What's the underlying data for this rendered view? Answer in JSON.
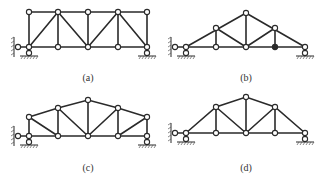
{
  "figure": {
    "panels": [
      {
        "id": "a",
        "label": "(a)",
        "type": "parallel-chord truss",
        "top_nodes": [
          [
            29,
            12
          ],
          [
            58,
            12
          ],
          [
            88,
            12
          ],
          [
            118,
            12
          ],
          [
            147,
            12
          ]
        ],
        "bottom_nodes": [
          [
            29,
            47
          ],
          [
            58,
            47
          ],
          [
            88,
            47
          ],
          [
            118,
            47
          ],
          [
            147,
            47
          ]
        ],
        "diagonals": [
          [
            [
              29,
              47
            ],
            [
              58,
              12
            ]
          ],
          [
            [
              58,
              12
            ],
            [
              88,
              47
            ]
          ],
          [
            [
              88,
              47
            ],
            [
              118,
              12
            ]
          ],
          [
            [
              118,
              12
            ],
            [
              147,
              47
            ]
          ]
        ],
        "solid_joints": [],
        "left_hinge": [
          18,
          47
        ],
        "supports": [
          [
            29,
            47
          ],
          [
            147,
            47
          ]
        ],
        "support_y": 59
      },
      {
        "id": "b",
        "label": "(b)",
        "type": "triangular roof truss",
        "bottom_nodes": [
          [
            186,
            47
          ],
          [
            216,
            47
          ],
          [
            246,
            47
          ],
          [
            275,
            47
          ],
          [
            305,
            47
          ]
        ],
        "upper_nodes": [
          [
            216,
            28
          ],
          [
            246,
            13
          ],
          [
            275,
            28
          ]
        ],
        "solid_joints": [
          [
            275,
            47
          ]
        ],
        "left_hinge": [
          175,
          47
        ],
        "supports": [
          [
            186,
            47
          ],
          [
            305,
            47
          ]
        ],
        "support_y": 59
      },
      {
        "id": "c",
        "label": "(c)",
        "type": "polygonal chord truss",
        "top_nodes": [
          [
            29,
            117
          ],
          [
            58,
            108
          ],
          [
            88,
            100
          ],
          [
            118,
            108
          ],
          [
            147,
            117
          ]
        ],
        "bottom_nodes": [
          [
            29,
            136
          ],
          [
            58,
            136
          ],
          [
            88,
            136
          ],
          [
            118,
            136
          ],
          [
            147,
            136
          ]
        ],
        "solid_joints": [],
        "left_hinge": [
          18,
          136
        ],
        "supports": [
          [
            29,
            136
          ],
          [
            147,
            136
          ]
        ],
        "support_y": 149
      },
      {
        "id": "d",
        "label": "(d)",
        "type": "trapezoidal roof truss",
        "bottom_nodes": [
          [
            186,
            133
          ],
          [
            216,
            133
          ],
          [
            246,
            133
          ],
          [
            275,
            133
          ],
          [
            305,
            133
          ]
        ],
        "upper_nodes": [
          [
            216,
            107
          ],
          [
            246,
            97
          ],
          [
            275,
            107
          ]
        ],
        "solid_joints": [],
        "left_hinge": [
          175,
          133
        ],
        "supports": [
          [
            186,
            133
          ],
          [
            305,
            133
          ]
        ],
        "support_y": 145
      }
    ],
    "colors": {
      "line": "#2a2a2a",
      "joint_fill": "#ffffff",
      "background": "#ffffff"
    }
  }
}
